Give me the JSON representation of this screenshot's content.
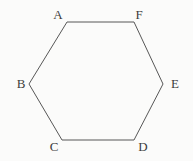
{
  "diagram": {
    "type": "hexagon",
    "background_color": "#fbfbfa",
    "stroke_color": "#575757",
    "stroke_width": 1,
    "label_color": "#3d3d3d",
    "width": 193,
    "height": 161,
    "vertices": [
      {
        "label": "A",
        "x": 67,
        "y": 22,
        "label_x": 58,
        "label_y": 19
      },
      {
        "label": "F",
        "x": 134,
        "y": 22,
        "label_x": 139,
        "label_y": 19
      },
      {
        "label": "E",
        "x": 163,
        "y": 84,
        "label_x": 175,
        "label_y": 88
      },
      {
        "label": "D",
        "x": 134,
        "y": 140,
        "label_x": 143,
        "label_y": 151
      },
      {
        "label": "C",
        "x": 62,
        "y": 140,
        "label_x": 54,
        "label_y": 151
      },
      {
        "label": "B",
        "x": 29,
        "y": 84,
        "label_x": 21,
        "label_y": 88
      }
    ]
  }
}
